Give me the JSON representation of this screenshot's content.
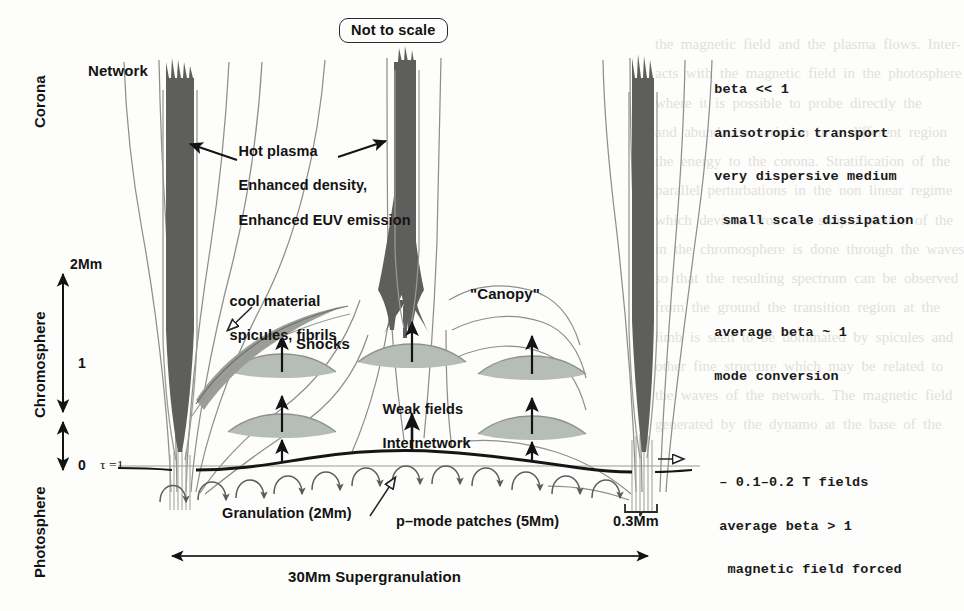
{
  "figure": {
    "badge": "Not to scale",
    "background_color": "#fdfdfb",
    "ink_color": "#131313",
    "flux_tube_color": "#5e5f5c",
    "fieldline_color": "#8e8f8b",
    "shock_color": "#b6bcb8"
  },
  "axis": {
    "regions": [
      {
        "name": "Corona",
        "label": "Corona"
      },
      {
        "name": "Chromosphere",
        "label": "Chromosphere"
      },
      {
        "name": "Photosphere",
        "label": "Photosphere"
      }
    ],
    "height_ticks": [
      "2Mm",
      "1",
      "0"
    ],
    "tau_label": "τ =1"
  },
  "labels": {
    "network": "Network",
    "hot_plasma": [
      "Hot plasma",
      "Enhanced density,",
      "Enhanced EUV emission"
    ],
    "cool_material": [
      "cool material",
      "spicules, fibrils"
    ],
    "shocks": "Shocks",
    "canopy": "\"Canopy\"",
    "weak_fields": [
      "Weak fields",
      "Internetwork"
    ],
    "granulation": "Granulation (2Mm)",
    "pmode": "p–mode patches (5Mm)",
    "tube_width": "0.3Mm",
    "supergranulation": "30Mm Supergranulation"
  },
  "annotations": {
    "corona_block": [
      "beta << 1",
      "anisotropic transport",
      "very dispersive medium",
      " small scale dissipation"
    ],
    "chromosphere_block": [
      "average beta ~ 1",
      "mode conversion"
    ],
    "photosphere_block": [
      "– 0.1–0.2 T fields",
      "average beta > 1",
      " magnetic field forced"
    ]
  },
  "bleed_text": {
    "top_left": "the  magnetic  field  and  the  plasma  flows.  Inter-\nacts  with  the  magnetic  field  in  the  photosphere\nwhere  it  is  possible  to  probe  directly  the\nand  abundance  variation  in  a  different  region\nthe  energy  to  the  corona.  Stratification  of  the\nparallel  perturbations  in  the  non  linear  regime\nwhich  deviates  from  the  simple  picture  of  the\nin  the  chromosphere  is  done  through  the  waves\nso  that  the  resulting  spectrum  can  be  observed\nfrom  the  ground  the  transition  region  at  the\nlimb  is  seen  to  be  dominated  by  spicules  and\nother  fine  structure  which  may  be  related  to\nthe  waves  of  the  network.  The  magnetic  field\ngenerated  by  the  dynamo  at  the  base  of  the"
  }
}
